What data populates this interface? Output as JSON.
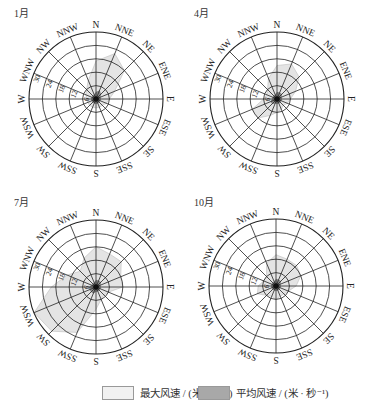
{
  "chart_data": [
    {
      "type": "radar",
      "title": "1月",
      "directions": [
        "N",
        "NNE",
        "NE",
        "ENE",
        "E",
        "ESE",
        "SE",
        "SSE",
        "S",
        "SSW",
        "SW",
        "WSW",
        "W",
        "WNW",
        "NW",
        "NNW"
      ],
      "radial_ticks": [
        6,
        12,
        18,
        24,
        30
      ],
      "rlim": [
        0,
        30
      ],
      "series": [
        {
          "name": "最大风速 / (米·秒⁻¹)",
          "values": [
            17,
            22,
            18,
            9,
            6,
            5,
            4,
            4,
            4,
            4,
            4,
            4,
            4,
            5,
            6,
            9
          ]
        },
        {
          "name": "平均风速 / (米·秒⁻¹)",
          "values": [
            3,
            4,
            3,
            2,
            2,
            2,
            2,
            2,
            2,
            2,
            2,
            2,
            2,
            2,
            2,
            2
          ]
        }
      ]
    },
    {
      "type": "radar",
      "title": "4月",
      "directions": [
        "N",
        "NNE",
        "NE",
        "ENE",
        "E",
        "ESE",
        "SE",
        "SSE",
        "S",
        "SSW",
        "SW",
        "WSW",
        "W",
        "WNW",
        "NW",
        "NNW"
      ],
      "radial_ticks": [
        6,
        12,
        18,
        24,
        30
      ],
      "rlim": [
        0,
        30
      ],
      "series": [
        {
          "name": "最大风速 / (米·秒⁻¹)",
          "values": [
            15,
            17,
            14,
            9,
            6,
            5,
            4,
            5,
            6,
            8,
            12,
            12,
            6,
            5,
            6,
            10
          ]
        },
        {
          "name": "平均风速 / (米·秒⁻¹)",
          "values": [
            3,
            3,
            3,
            2,
            2,
            2,
            2,
            2,
            2,
            2,
            3,
            3,
            2,
            2,
            2,
            2
          ]
        }
      ]
    },
    {
      "type": "radar",
      "title": "7月",
      "directions": [
        "N",
        "NNE",
        "NE",
        "ENE",
        "E",
        "ESE",
        "SE",
        "SSE",
        "S",
        "SSW",
        "SW",
        "WSW",
        "W",
        "WNW",
        "NW",
        "NNW"
      ],
      "radial_ticks": [
        6,
        12,
        18,
        24,
        30
      ],
      "rlim": [
        0,
        30
      ],
      "series": [
        {
          "name": "最大风速 / (米·秒⁻¹)",
          "values": [
            18,
            16,
            16,
            12,
            12,
            6,
            5,
            6,
            10,
            22,
            28,
            30,
            20,
            14,
            10,
            14
          ]
        },
        {
          "name": "平均风速 / (米·秒⁻¹)",
          "values": [
            3,
            3,
            3,
            2,
            2,
            2,
            2,
            2,
            2,
            3,
            3,
            3,
            3,
            2,
            2,
            2
          ]
        }
      ]
    },
    {
      "type": "radar",
      "title": "10月",
      "directions": [
        "N",
        "NNE",
        "NE",
        "ENE",
        "E",
        "ESE",
        "SE",
        "SSE",
        "S",
        "SSW",
        "SW",
        "WSW",
        "W",
        "WNW",
        "NW",
        "NNW"
      ],
      "radial_ticks": [
        6,
        12,
        18,
        24,
        30
      ],
      "rlim": [
        0,
        30
      ],
      "series": [
        {
          "name": "最大风速 / (米·秒⁻¹)",
          "values": [
            14,
            13,
            13,
            12,
            9,
            6,
            5,
            5,
            6,
            5,
            6,
            9,
            8,
            6,
            6,
            11
          ]
        },
        {
          "name": "平均风速 / (米·秒⁻¹)",
          "values": [
            3,
            3,
            3,
            2,
            2,
            2,
            2,
            2,
            2,
            2,
            2,
            2,
            2,
            2,
            2,
            2
          ]
        }
      ]
    }
  ],
  "legend": {
    "max_label": "最大风速 / (米 · 秒⁻¹)",
    "avg_label": "平均风速 / (米 · 秒⁻¹)"
  },
  "colors": {
    "grid": "#222222",
    "max_fill": "#e4e4e4",
    "avg_fill": "#8c8c8c"
  }
}
